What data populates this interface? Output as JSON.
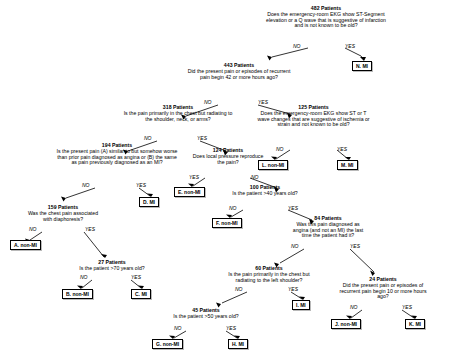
{
  "diagram": {
    "edge_labels": {
      "no": "NO",
      "yes": "YES"
    },
    "nodes": [
      {
        "id": "n482",
        "count": "482 Patients",
        "question": "Does the emergency-room EKG show ST-Segment elevation or a Q wave that is suggestive of infarction and is not known to be old?"
      },
      {
        "id": "n443",
        "count": "443 Patients",
        "question": "Did the present pain or episodes of recurrent pain begin 42 or more hours ago?"
      },
      {
        "id": "n125",
        "count": "125 Patients",
        "question": "Does the emergency-room EKG show ST or T wave changes that are suggestive of ischemia or strain and not known to be old?"
      },
      {
        "id": "n318",
        "count": "318 Patients",
        "question": "Is the pain primarily in the chest but radiating to the shoulder, neck, or arms?"
      },
      {
        "id": "n124",
        "count": "124 Patients",
        "question": "Does local pressure reproduce the pain?"
      },
      {
        "id": "n194",
        "count": "194 Patients",
        "question": "Is the present pain (A) similar to but somehow worse than prior pain diagnosed as angina or (B) the same as pain previously diagnosed as an MI?"
      },
      {
        "id": "n100",
        "count": "100 Patients",
        "question": "Is the patient >40 years old?"
      },
      {
        "id": "n159",
        "count": "159 Patients",
        "question": "Was the chest pain associated with diaphoresis?"
      },
      {
        "id": "n84",
        "count": "84 Patients",
        "question": "Was this pain diagnosed as angina (and not an MI) the last time the patient had it?"
      },
      {
        "id": "n27",
        "count": "27 Patients",
        "question": "Is the patient >70 years old?"
      },
      {
        "id": "n60",
        "count": "60 Patients",
        "question": "Is the pain primarily in the chest but radiating to the left shoulder?"
      },
      {
        "id": "n24",
        "count": "24 Patients",
        "question": "Did the present pain or episodes of recurrent pain begin 10 or more hours ago?"
      },
      {
        "id": "n45",
        "count": "45 Patients",
        "question": "Is the patient >50 years old?"
      }
    ],
    "leaves": [
      {
        "id": "lN",
        "label": "N. MI"
      },
      {
        "id": "lL",
        "label": "L. non-MI"
      },
      {
        "id": "lM",
        "label": "M. MI"
      },
      {
        "id": "lE",
        "label": "E. non-MI"
      },
      {
        "id": "lD",
        "label": "D. MI"
      },
      {
        "id": "lF",
        "label": "F. non-MI"
      },
      {
        "id": "lA",
        "label": "A. non-MI"
      },
      {
        "id": "lB",
        "label": "B. non-MI"
      },
      {
        "id": "lC",
        "label": "C. MI"
      },
      {
        "id": "lI",
        "label": "I. MI"
      },
      {
        "id": "lJ",
        "label": "J. non-MI"
      },
      {
        "id": "lK",
        "label": "K. MI"
      },
      {
        "id": "lG",
        "label": "G. non-MI"
      },
      {
        "id": "lH",
        "label": "H. MI"
      }
    ]
  }
}
